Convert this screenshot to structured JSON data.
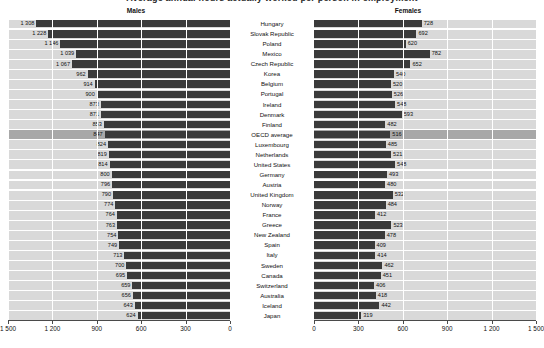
{
  "cut_title": "Average annual hours actually worked per person in employment",
  "panels": {
    "males_header": "Males",
    "females_header": "Females"
  },
  "axis": {
    "left_ticks": [
      "1 500",
      "1 200",
      "900",
      "600",
      "300",
      "0"
    ],
    "right_ticks": [
      "0",
      "300",
      "600",
      "900",
      "1 200",
      "1 500"
    ]
  },
  "chart_data": {
    "type": "bar",
    "title": "Average annual hours actually worked per person in employment",
    "orientation": "horizontal",
    "layout": "back-to-back population pyramid; left panel Males (axis reversed 1500→0), right panel Females (axis 0→1500)",
    "xlabel": "",
    "ylabel": "",
    "xlim": [
      0,
      1500
    ],
    "grid": true,
    "legend": null,
    "highlight_category": "OECD average",
    "categories": [
      "Hungary",
      "Slovak Republic",
      "Poland",
      "Mexico",
      "Czech Republic",
      "Korea",
      "Belgium",
      "Portugal",
      "Ireland",
      "Denmark",
      "Finland",
      "OECD average",
      "Luxembourg",
      "Netherlands",
      "United States",
      "Germany",
      "Austria",
      "United Kingdom",
      "Norway",
      "France",
      "Greece",
      "New Zealand",
      "Spain",
      "Italy",
      "Sweden",
      "Canada",
      "Switzerland",
      "Australia",
      "Iceland",
      "Japan"
    ],
    "series": [
      {
        "name": "Males",
        "values": [
          1308,
          1228,
          1146,
          1039,
          1067,
          962,
          914,
          900,
          873,
          871,
          853,
          847,
          824,
          819,
          814,
          800,
          796,
          790,
          774,
          764,
          763,
          754,
          749,
          713,
          700,
          695,
          659,
          656,
          643,
          624
        ]
      },
      {
        "name": "Females",
        "values": [
          728,
          692,
          620,
          782,
          652,
          540,
          520,
          526,
          548,
          593,
          482,
          516,
          485,
          521,
          548,
          493,
          480,
          532,
          484,
          412,
          523,
          478,
          409,
          414,
          462,
          451,
          406,
          418,
          442,
          319
        ]
      }
    ]
  }
}
